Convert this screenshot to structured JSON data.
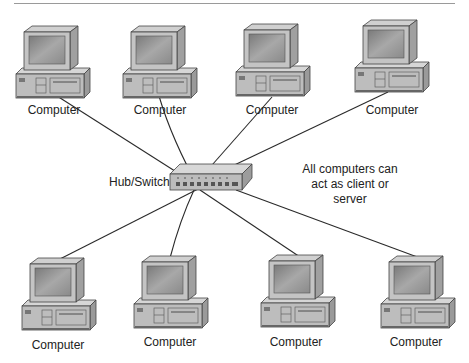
{
  "diagram": {
    "type": "network-topology",
    "hub": {
      "label": "Hub/Switch",
      "icon": "hub-switch-icon"
    },
    "note": {
      "lines": [
        "All computers can",
        "act as client or",
        "server"
      ]
    },
    "computers": [
      {
        "id": "pc1",
        "label": "Computer",
        "row": "top"
      },
      {
        "id": "pc2",
        "label": "Computer",
        "row": "top"
      },
      {
        "id": "pc3",
        "label": "Computer",
        "row": "top"
      },
      {
        "id": "pc4",
        "label": "Computer",
        "row": "top"
      },
      {
        "id": "pc5",
        "label": "Computer",
        "row": "bottom"
      },
      {
        "id": "pc6",
        "label": "Computer",
        "row": "bottom"
      },
      {
        "id": "pc7",
        "label": "Computer",
        "row": "bottom"
      },
      {
        "id": "pc8",
        "label": "Computer",
        "row": "bottom"
      }
    ],
    "edges": [
      [
        "pc1",
        "hub"
      ],
      [
        "pc2",
        "hub"
      ],
      [
        "pc3",
        "hub"
      ],
      [
        "pc4",
        "hub"
      ],
      [
        "pc5",
        "hub"
      ],
      [
        "pc6",
        "hub"
      ],
      [
        "pc7",
        "hub"
      ],
      [
        "pc8",
        "hub"
      ]
    ],
    "colors": {
      "case": "#bdbdbd",
      "screen": "#8e8e8e",
      "line": "#2a2a2a",
      "rule": "#9a9a9a"
    }
  }
}
